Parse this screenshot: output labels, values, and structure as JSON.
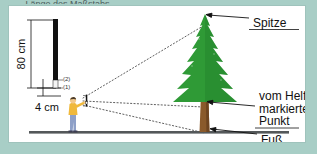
{
  "figure": {
    "caption_top": "...Länge des Maßstabs",
    "background_color": "#a8cec6",
    "panel_color": "#ffffff"
  },
  "scale_bar": {
    "height_label": "80 cm",
    "width_label": "4 cm",
    "marker_lower": "(1)",
    "marker_upper": "(2)",
    "rod_color": "#111111",
    "segment_color": "#f2f2f2"
  },
  "annotations": {
    "tip": "Spitze",
    "marked_point_line1": "vom Helfer",
    "marked_point_line2": "markierter",
    "marked_point_line3": "Punkt",
    "foot": "Fuß"
  },
  "tree": {
    "foliage_color": "#2f9a36",
    "foliage_shadow": "#1f7a28",
    "trunk_color": "#8a5a2b",
    "trunk_dark": "#6e4520"
  },
  "person": {
    "shirt_color": "#f0b93c",
    "pants_color": "#8ea0c8",
    "skin_color": "#f3c98b",
    "hair_color": "#4a3b2a"
  },
  "ground": {
    "color": "#54585a"
  },
  "sight_lines": {
    "color": "#555555",
    "style": "dotted"
  }
}
